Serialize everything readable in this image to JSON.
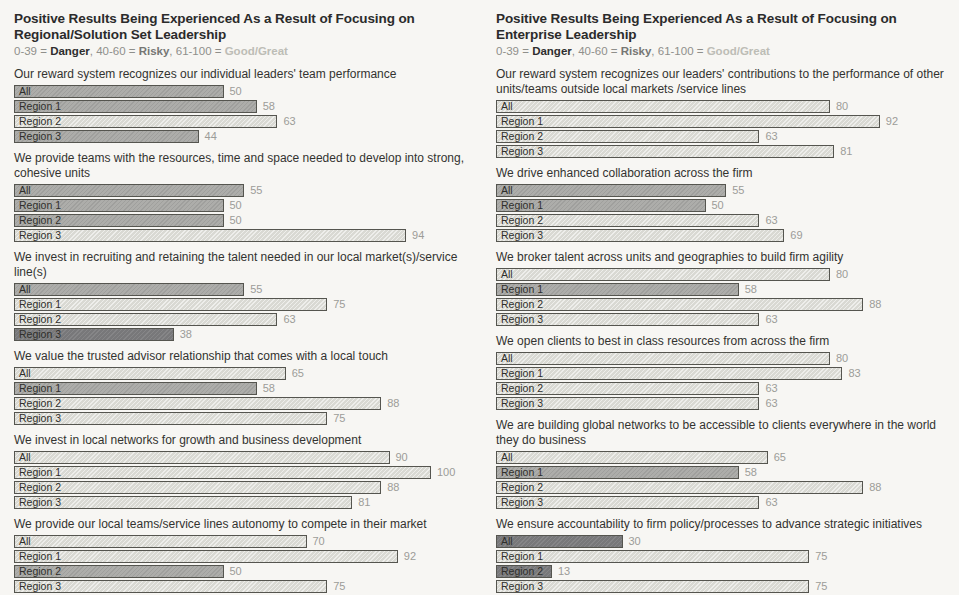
{
  "legend": {
    "segments": [
      {
        "text": "0-39 = ",
        "class": "plain"
      },
      {
        "text": "Danger",
        "class": "danger"
      },
      {
        "text": ", 40-60 = ",
        "class": "plain"
      },
      {
        "text": "Risky",
        "class": "risky"
      },
      {
        "text": ", 61-100 = ",
        "class": "plain"
      },
      {
        "text": "Good/Great",
        "class": "good"
      }
    ]
  },
  "colors": {
    "danger_fill": "#78787a",
    "risky_fill": "#adadaa",
    "good_great_fill": "#d9d9d3",
    "bar_border": "#55554f",
    "value_text": "#9c9c98",
    "title_text": "#2b2b2b",
    "background": "#f7f6f3"
  },
  "chart_data": [
    {
      "type": "bar",
      "orientation": "horizontal",
      "title": "Positive Results Being Experienced As a Result of Focusing on Regional/Solution Set Leadership",
      "legend_text": "0-39 = Danger, 40-60 = Risky, 61-100 = Good/Great",
      "xlim": [
        0,
        100
      ],
      "categories": [
        "All",
        "Region 1",
        "Region 2",
        "Region 3"
      ],
      "band_thresholds": {
        "danger": [
          0,
          39
        ],
        "risky": [
          40,
          60
        ],
        "good_great": [
          61,
          100
        ]
      },
      "groups": [
        {
          "question": "Our reward system recognizes our individual leaders' team performance",
          "values": [
            50,
            58,
            63,
            44
          ]
        },
        {
          "question": "We provide teams with the resources, time and space needed to develop into strong, cohesive units",
          "values": [
            55,
            50,
            50,
            94
          ]
        },
        {
          "question": "We invest in recruiting and retaining the talent needed in our local market(s)/service line(s)",
          "values": [
            55,
            75,
            63,
            38
          ]
        },
        {
          "question": "We value the trusted advisor relationship that comes with a local touch",
          "values": [
            65,
            58,
            88,
            75
          ]
        },
        {
          "question": "We invest in local networks for growth and business development",
          "values": [
            90,
            100,
            88,
            81
          ]
        },
        {
          "question": "We provide our local teams/service lines autonomy to compete in their market",
          "values": [
            70,
            92,
            50,
            75
          ]
        }
      ]
    },
    {
      "type": "bar",
      "orientation": "horizontal",
      "title": "Positive Results Being Experienced As a Result of Focusing on Enterprise Leadership",
      "legend_text": "0-39 = Danger, 40-60 = Risky, 61-100 = Good/Great",
      "xlim": [
        0,
        100
      ],
      "categories": [
        "All",
        "Region 1",
        "Region 2",
        "Region 3"
      ],
      "band_thresholds": {
        "danger": [
          0,
          39
        ],
        "risky": [
          40,
          60
        ],
        "good_great": [
          61,
          100
        ]
      },
      "groups": [
        {
          "question": "Our reward system recognizes our leaders' contributions to the performance of other units/teams outside local markets /service lines",
          "values": [
            80,
            92,
            63,
            81
          ]
        },
        {
          "question": "We drive enhanced collaboration across the firm",
          "values": [
            55,
            50,
            63,
            69
          ]
        },
        {
          "question": "We broker talent across units and geographies to build firm agility",
          "values": [
            80,
            58,
            88,
            63
          ]
        },
        {
          "question": "We open clients to best in class resources from across the firm",
          "values": [
            80,
            83,
            63,
            63
          ]
        },
        {
          "question": "We are building global networks to be accessible to clients everywhere in the world they do business",
          "values": [
            65,
            58,
            88,
            63
          ]
        },
        {
          "question": "We ensure accountability to firm policy/processes to advance strategic initiatives",
          "values": [
            30,
            75,
            13,
            75
          ]
        }
      ]
    }
  ]
}
